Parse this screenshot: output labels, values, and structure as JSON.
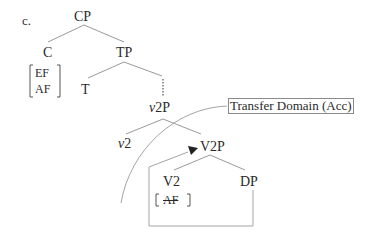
{
  "diagram": {
    "example_label": "c.",
    "nodes": {
      "cp": "CP",
      "c": "C",
      "tp": "TP",
      "t": "T",
      "v2p_italic_prefix": "v",
      "v2p_suffix": "2P",
      "v2_italic_prefix": "v",
      "v2_suffix": "2",
      "V2P": "V2P",
      "V2": "V2",
      "dp": "DP"
    },
    "c_features": [
      "EF",
      "AF"
    ],
    "v2_feature": "AF",
    "v2_feature_struck": true,
    "transfer_label": "Transfer Domain (Acc)",
    "colors": {
      "text": "#2a2a2a",
      "lines": "#9a9a9a",
      "box": "#8a8a8a"
    }
  }
}
